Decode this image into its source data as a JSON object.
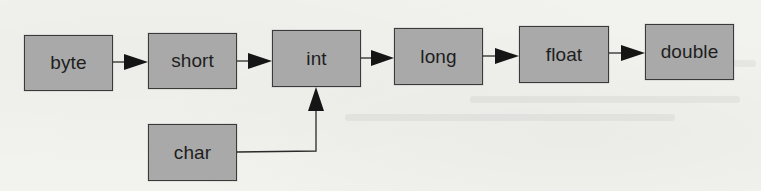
{
  "diagram": {
    "title": "",
    "colors": {
      "background": "#f2f2ef",
      "node_fill": "#a9a9a9",
      "node_border": "#3a3a3a",
      "edge": "#2a2a2a",
      "text": "#1e1e1e"
    },
    "nodes": [
      {
        "id": "byte",
        "label": "byte",
        "x": 24,
        "y": 35,
        "w": 89,
        "h": 56
      },
      {
        "id": "short",
        "label": "short",
        "x": 148,
        "y": 33,
        "w": 89,
        "h": 56
      },
      {
        "id": "int",
        "label": "int",
        "x": 272,
        "y": 30,
        "w": 89,
        "h": 57
      },
      {
        "id": "long",
        "label": "long",
        "x": 394,
        "y": 28,
        "w": 89,
        "h": 57
      },
      {
        "id": "float",
        "label": "float",
        "x": 519,
        "y": 26,
        "w": 90,
        "h": 57
      },
      {
        "id": "double",
        "label": "double",
        "x": 645,
        "y": 24,
        "w": 89,
        "h": 56
      },
      {
        "id": "char",
        "label": "char",
        "x": 148,
        "y": 124,
        "w": 89,
        "h": 57
      }
    ],
    "edges": [
      {
        "from": "byte",
        "to": "short"
      },
      {
        "from": "short",
        "to": "int"
      },
      {
        "from": "int",
        "to": "long"
      },
      {
        "from": "long",
        "to": "float"
      },
      {
        "from": "float",
        "to": "double"
      },
      {
        "from": "char",
        "to": "int",
        "routing": "right-then-up"
      }
    ]
  }
}
